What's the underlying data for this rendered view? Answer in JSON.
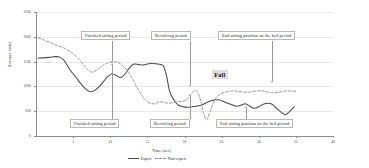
{
  "chart_data": {
    "type": "line",
    "title": "",
    "xlabel": "Time (sec)",
    "ylabel": "Distance (mm)",
    "xlim": [
      0,
      40
    ],
    "ylim": [
      0,
      2500
    ],
    "xticks": [
      "5",
      "10",
      "15",
      "20",
      "25",
      "30",
      "35",
      "40"
    ],
    "xtick_values": [
      5,
      10,
      15,
      20,
      25,
      30,
      35,
      40
    ],
    "yticks": [
      "0",
      "500",
      "1000",
      "1500",
      "2000",
      "2500"
    ],
    "ytick_values": [
      0,
      500,
      1000,
      1500,
      2000,
      2500
    ],
    "grid": true,
    "legend_position": "bottom-center",
    "series": [
      {
        "name": "Expert",
        "style": "solid",
        "color": "#4a4a4a",
        "x": [
          0.3,
          1.0,
          1.8,
          2.6,
          3.2,
          3.8,
          4.3,
          4.8,
          5.4,
          6.0,
          6.6,
          7.2,
          7.8,
          8.4,
          9.0,
          9.6,
          10.2,
          10.8,
          11.4,
          12.0,
          12.6,
          13.2,
          13.8,
          14.4,
          15.0,
          15.6,
          16.2,
          16.8,
          17.2,
          17.6,
          18.0,
          18.6,
          19.2,
          19.8,
          20.4,
          21.0,
          21.6,
          22.2,
          22.8,
          23.4,
          24.0,
          24.6,
          25.2,
          25.8,
          26.4,
          27.0,
          27.6,
          28.2,
          28.8,
          29.4,
          30.0,
          30.6,
          31.2,
          31.8,
          32.4,
          33.0,
          33.6,
          34.2,
          34.8
        ],
        "y": [
          1570,
          1575,
          1585,
          1600,
          1590,
          1520,
          1400,
          1290,
          1180,
          1060,
          960,
          895,
          910,
          980,
          1080,
          1190,
          1250,
          1220,
          1180,
          1250,
          1380,
          1450,
          1440,
          1430,
          1450,
          1465,
          1455,
          1440,
          1400,
          1200,
          900,
          720,
          620,
          590,
          580,
          590,
          600,
          620,
          660,
          700,
          725,
          730,
          700,
          660,
          630,
          600,
          620,
          650,
          600,
          560,
          590,
          640,
          660,
          640,
          560,
          480,
          430,
          500,
          590
        ]
      },
      {
        "name": "Non-expert",
        "style": "dashed",
        "color": "#9a9a9a",
        "x": [
          0.3,
          1.0,
          1.8,
          2.6,
          3.4,
          4.2,
          5.0,
          5.8,
          6.6,
          7.4,
          8.2,
          9.0,
          9.8,
          10.6,
          11.2,
          11.8,
          12.4,
          13.0,
          13.6,
          14.2,
          14.8,
          15.4,
          16.0,
          16.6,
          17.2,
          17.8,
          18.4,
          19.0,
          19.6,
          20.2,
          20.8,
          21.4,
          21.8,
          22.2,
          22.6,
          23.0,
          23.6,
          24.2,
          24.8,
          25.4,
          26.0,
          26.6,
          27.2,
          27.8,
          28.4,
          29.0,
          29.6,
          30.2,
          30.8,
          31.4,
          32.0,
          32.6,
          33.2,
          33.8,
          34.4,
          35.0
        ],
        "y": [
          1980,
          1940,
          1890,
          1840,
          1800,
          1740,
          1660,
          1540,
          1400,
          1290,
          1330,
          1420,
          1480,
          1500,
          1470,
          1400,
          1300,
          1150,
          980,
          830,
          720,
          660,
          650,
          690,
          680,
          660,
          670,
          690,
          700,
          720,
          830,
          920,
          880,
          700,
          450,
          330,
          560,
          760,
          840,
          880,
          900,
          910,
          900,
          890,
          880,
          890,
          905,
          915,
          900,
          880,
          870,
          880,
          900,
          910,
          905,
          900
        ]
      }
    ],
    "annotations": [
      {
        "id": "finished-sitting-top",
        "text": "Finished sitting period",
        "position": "top"
      },
      {
        "id": "revolving-top",
        "text": "Revolving period",
        "position": "top"
      },
      {
        "id": "end-sitting-top",
        "text": "End sitting position on the bed period",
        "position": "top"
      },
      {
        "id": "finished-sitting-bottom",
        "text": "Finished sitting period",
        "position": "bottom"
      },
      {
        "id": "revolving-bottom",
        "text": "Revolving period",
        "position": "bottom"
      },
      {
        "id": "end-sitting-bottom",
        "text": "End sitting position on the bed period",
        "position": "bottom"
      },
      {
        "id": "fall",
        "text": "Fall",
        "position": "inline"
      }
    ]
  },
  "legend": {
    "expert_label": "Expert",
    "nonexpert_label": "Non-expert"
  }
}
